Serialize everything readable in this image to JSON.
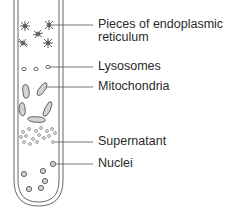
{
  "diagram": {
    "labels": [
      {
        "line1": "Pieces of endoplasmic",
        "line2": "reticulum"
      },
      {
        "line1": "Lysosomes"
      },
      {
        "line1": "Mitochondria"
      },
      {
        "line1": "Supernatant"
      },
      {
        "line1": "Nuclei"
      }
    ],
    "colors": {
      "line": "#555555",
      "organelle_fill": "#cfcfcf",
      "text": "#2a2a2a"
    }
  }
}
